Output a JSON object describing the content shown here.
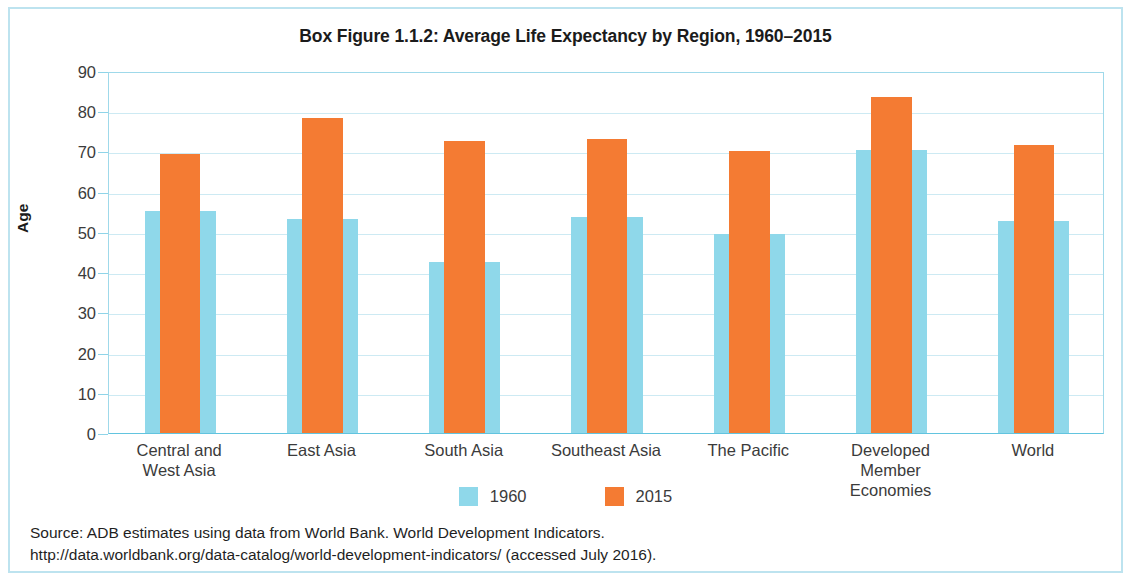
{
  "chart_data": {
    "type": "bar",
    "title": "Box Figure 1.1.2:  Average Life Expectancy by Region, 1960–2015",
    "xlabel": "",
    "ylabel": "Age",
    "ylim": [
      0,
      90
    ],
    "ytick_step": 10,
    "yticks": [
      90,
      80,
      70,
      60,
      50,
      40,
      30,
      20,
      10,
      0
    ],
    "grid": true,
    "legend_position": "bottom",
    "categories": [
      "Central and\nWest Asia",
      "East Asia",
      "South Asia",
      "Southeast Asia",
      "The Pacific",
      "Developed Member\nEconomies",
      "World"
    ],
    "series": [
      {
        "name": "1960",
        "color": "#8fd8ea",
        "values": [
          55.2,
          53.2,
          42.5,
          53.6,
          49.6,
          70.3,
          52.8
        ]
      },
      {
        "name": "2015",
        "color": "#f47b33",
        "values": [
          69.3,
          78.4,
          72.7,
          73.2,
          70.1,
          83.5,
          71.6
        ]
      }
    ]
  },
  "category_lines": [
    [
      "Central and",
      "West Asia"
    ],
    [
      "East Asia"
    ],
    [
      "South Asia"
    ],
    [
      "Southeast Asia"
    ],
    [
      "The Pacific"
    ],
    [
      "Developed Member",
      "Economies"
    ],
    [
      "World"
    ]
  ],
  "legend": [
    {
      "label": "1960",
      "color": "#8fd8ea"
    },
    {
      "label": "2015",
      "color": "#f47b33"
    }
  ],
  "source": {
    "line1": "Source:  ADB estimates using data from World Bank. World Development Indicators.",
    "line2": "http://data.worldbank.org/data-catalog/world-development-indicators/ (accessed July 2016)."
  },
  "colors": {
    "frame": "#bde3ef",
    "gridline": "#cdeaf3",
    "axis": "#62c4df",
    "series_1960": "#8fd8ea",
    "series_2015": "#f47b33",
    "text": "#3b3b3b"
  }
}
